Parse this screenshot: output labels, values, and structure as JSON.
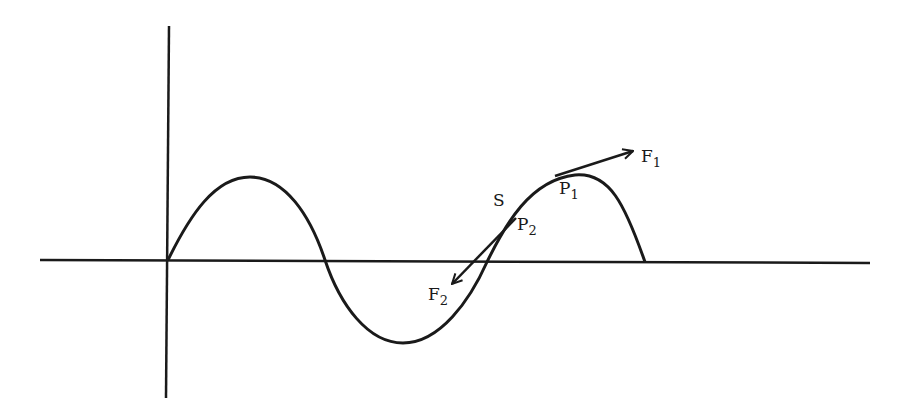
{
  "figure": {
    "type": "sine-wave-force-diagram",
    "stroke_color": "#1a1a1a",
    "background": "#ffffff"
  },
  "axes": {
    "origin": {
      "x": 168,
      "y": 260
    },
    "x_axis": {
      "x1": 40,
      "x2": 870
    },
    "y_axis": {
      "y1": 26,
      "y2": 398
    }
  },
  "curve": {
    "description": "sine wave: crest, trough, then truncated crest ending on axis",
    "crest1": {
      "x": 250,
      "y": 177
    },
    "zero1": {
      "x": 325,
      "y": 260
    },
    "trough": {
      "x": 403,
      "y": 343
    },
    "zero2": {
      "x": 487,
      "y": 260
    },
    "crest2": {
      "x": 580,
      "y": 175
    },
    "end": {
      "x": 645,
      "y": 262
    }
  },
  "labels": {
    "s": {
      "text": "S"
    },
    "p1": {
      "base": "P",
      "sub": "1"
    },
    "p2": {
      "base": "P",
      "sub": "2"
    },
    "f1": {
      "base": "F",
      "sub": "1"
    },
    "f2": {
      "base": "F",
      "sub": "2"
    }
  },
  "vectors": {
    "f1": {
      "from": {
        "x": 555,
        "y": 176
      },
      "to": {
        "x": 633,
        "y": 151
      }
    },
    "f2": {
      "from": {
        "x": 516,
        "y": 218
      },
      "to": {
        "x": 452,
        "y": 284
      }
    }
  }
}
